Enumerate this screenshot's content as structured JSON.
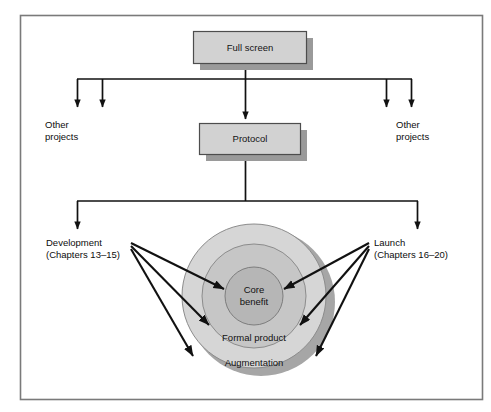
{
  "figure": {
    "frame_color": "#7a7a7a",
    "background_color": "#ffffff"
  },
  "boxes": [
    {
      "id": "full-screen",
      "label": "Full screen",
      "fill": "#cfcfcf",
      "stroke": "#4d4d4d",
      "shadow": "#9a9a9a",
      "x": 193,
      "y": 31,
      "width": 113,
      "height": 32
    },
    {
      "id": "protocol",
      "label": "Protocol",
      "fill": "#cfcfcf",
      "stroke": "#4d4d4d",
      "shadow": "#9a9a9a",
      "x": 199,
      "y": 123,
      "width": 101,
      "height": 31
    }
  ],
  "side_labels": [
    {
      "id": "other-projects-left",
      "line1": "Other",
      "line2": "projects",
      "x": 45,
      "y": 124
    },
    {
      "id": "other-projects-right",
      "line1": "Other",
      "line2": "projects",
      "x": 396,
      "y": 124
    },
    {
      "id": "development",
      "line1": "Development",
      "line2": "(Chapters 13–15)",
      "x": 46,
      "y": 242
    },
    {
      "id": "launch",
      "line1": "Launch",
      "line2": "(Chapters 16–20)",
      "x": 374,
      "y": 242
    }
  ],
  "rings": [
    {
      "id": "augmentation",
      "label": "Augmentation",
      "fill": "#d4d4d4",
      "stroke": "#8c8c8c",
      "cx": 254,
      "cy": 296,
      "r": 72,
      "label_x": 254,
      "label_y": 365
    },
    {
      "id": "formal-product",
      "label": "Formal product",
      "fill": "#c4c4c4",
      "stroke": "#8c8c8c",
      "cx": 254,
      "cy": 296,
      "r": 52,
      "label_x": 254,
      "label_y": 340
    },
    {
      "id": "core-benefit",
      "label_line1": "Core",
      "label_line2": "benefit",
      "fill": "#b4b4b4",
      "stroke": "#7d7d7d",
      "cx": 254,
      "cy": 296,
      "r": 29,
      "label_x": 254,
      "label_y": 293
    }
  ],
  "ring_shadow": {
    "cx": 261,
    "cy": 302,
    "r": 74,
    "fill": "#a6a6a6"
  },
  "connectors": {
    "stroke": "#111111",
    "tier1_bus_y": 79,
    "tier1_bus_x1": 77,
    "tier1_bus_x2": 412,
    "tier1_arrow_x": [
      77,
      102,
      245,
      386,
      412
    ],
    "tier1_arrow_y_end": 110,
    "tier2_bus_y": 201,
    "tier2_bus_x1": 77,
    "tier2_bus_x2": 418,
    "tier2_arrow_x": [
      77,
      418
    ],
    "tier2_arrow_y_end": 231
  },
  "pointer_arrows": [
    {
      "id": "dev-to-core",
      "from_x": 131,
      "from_y": 243,
      "to_x": 227,
      "to_y": 291
    },
    {
      "id": "dev-to-formal",
      "from_x": 131,
      "from_y": 247,
      "to_x": 212,
      "to_y": 327
    },
    {
      "id": "dev-to-augmentation",
      "from_x": 131,
      "from_y": 250,
      "to_x": 196,
      "to_y": 358
    },
    {
      "id": "launch-to-core",
      "from_x": 369,
      "from_y": 243,
      "to_x": 281,
      "to_y": 291
    },
    {
      "id": "launch-to-formal",
      "from_x": 369,
      "from_y": 247,
      "to_x": 297,
      "to_y": 327
    },
    {
      "id": "launch-to-augmentation",
      "from_x": 369,
      "from_y": 250,
      "to_x": 313,
      "to_y": 358
    }
  ]
}
